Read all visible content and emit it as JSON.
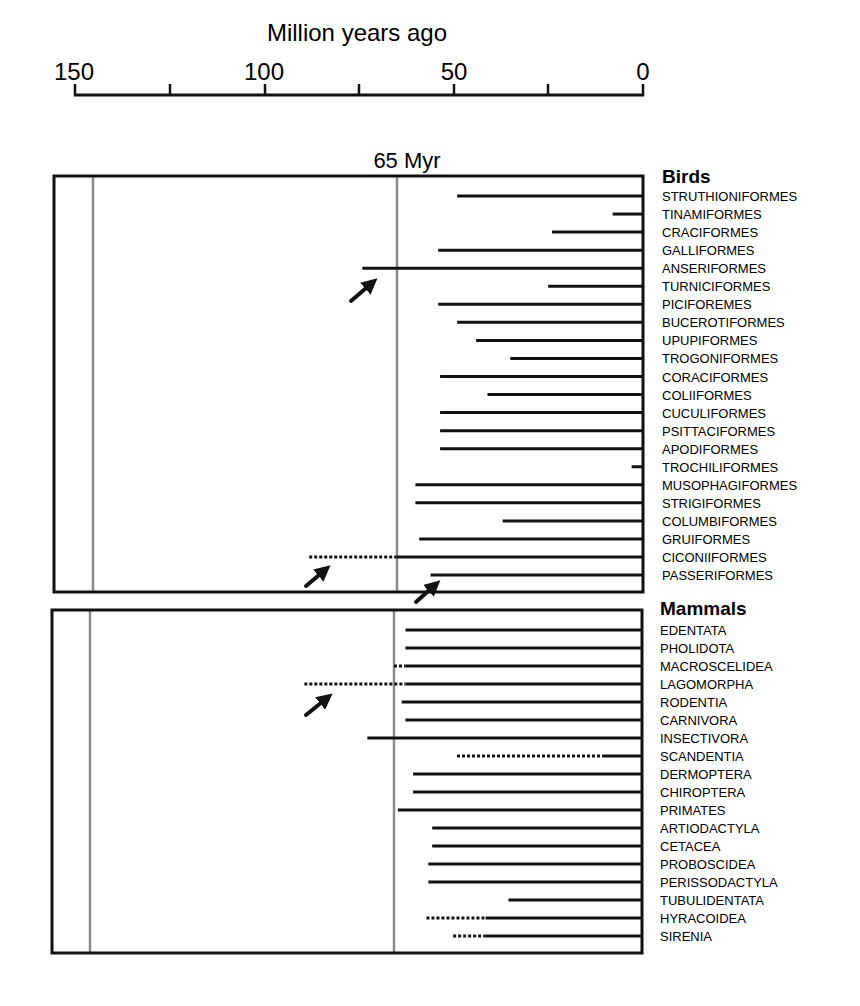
{
  "chart_data": {
    "type": "bar",
    "subtype": "horizontal range bars (divergence timelines)",
    "title": "",
    "xlabel": "Million years ago",
    "ylabel": "",
    "xlim": [
      150,
      0
    ],
    "x_ticks_major": [
      150,
      100,
      50,
      0
    ],
    "x_ticks_minor": [
      125,
      75,
      25
    ],
    "reference_line": {
      "value": 65,
      "label": "65 Myr"
    },
    "secondary_reference_line": {
      "value": 145
    },
    "legend": {
      "solid": "fossil/confirmed range",
      "dotted": "extended (molecular) estimate"
    },
    "groups": [
      {
        "name": "Birds",
        "orders": [
          {
            "name": "STRUTHIONIFORMES",
            "solid_start": 49,
            "dotted_start": null
          },
          {
            "name": "TINAMIFORMES",
            "solid_start": 8,
            "dotted_start": null
          },
          {
            "name": "CRACIFORMES",
            "solid_start": 24,
            "dotted_start": null
          },
          {
            "name": "GALLIFORMES",
            "solid_start": 54,
            "dotted_start": null
          },
          {
            "name": "ANSERIFORMES",
            "solid_start": 74,
            "dotted_start": null,
            "arrow": true
          },
          {
            "name": "TURNICIFORMES",
            "solid_start": 25,
            "dotted_start": null
          },
          {
            "name": "PICIFOREMES",
            "solid_start": 54,
            "dotted_start": null
          },
          {
            "name": "BUCEROTIFORMES",
            "solid_start": 49,
            "dotted_start": null
          },
          {
            "name": "UPUPIFORMES",
            "solid_start": 44,
            "dotted_start": null
          },
          {
            "name": "TROGONIFORMES",
            "solid_start": 35,
            "dotted_start": null
          },
          {
            "name": "CORACIFORMES",
            "solid_start": 53.5,
            "dotted_start": null
          },
          {
            "name": "COLIIFORMES",
            "solid_start": 41,
            "dotted_start": null
          },
          {
            "name": "CUCULIFORMES",
            "solid_start": 53.5,
            "dotted_start": null
          },
          {
            "name": "PSITTACIFORMES",
            "solid_start": 53.5,
            "dotted_start": null
          },
          {
            "name": "APODIFORMES",
            "solid_start": 53.5,
            "dotted_start": null
          },
          {
            "name": "TROCHILIFORMES",
            "solid_start": 3,
            "dotted_start": null
          },
          {
            "name": "MUSOPHAGIFORMES",
            "solid_start": 60,
            "dotted_start": null
          },
          {
            "name": "STRIGIFORMES",
            "solid_start": 60,
            "dotted_start": null
          },
          {
            "name": "COLUMBIFORMES",
            "solid_start": 37,
            "dotted_start": null
          },
          {
            "name": "GRUIFORMES",
            "solid_start": 59,
            "dotted_start": null
          },
          {
            "name": "CICONIIFORMES",
            "solid_start": 65,
            "dotted_start": 88,
            "arrow": true
          },
          {
            "name": "PASSERIFORMES",
            "solid_start": 56,
            "dotted_start": null,
            "arrow": true
          }
        ]
      },
      {
        "name": "Mammals",
        "orders": [
          {
            "name": "EDENTATA",
            "solid_start": 62,
            "dotted_start": null
          },
          {
            "name": "PHOLIDOTA",
            "solid_start": 62,
            "dotted_start": null
          },
          {
            "name": "MACROSCELIDEA",
            "solid_start": 62,
            "dotted_start": 65
          },
          {
            "name": "LAGOMORPHA",
            "solid_start": 62,
            "dotted_start": 88.5,
            "arrow": true
          },
          {
            "name": "RODENTIA",
            "solid_start": 63,
            "dotted_start": null
          },
          {
            "name": "CARNIVORA",
            "solid_start": 62,
            "dotted_start": null
          },
          {
            "name": "INSECTIVORA",
            "solid_start": 72,
            "dotted_start": null
          },
          {
            "name": "SCANDENTIA",
            "solid_start": 10,
            "dotted_start": 48.5
          },
          {
            "name": "DERMOPTERA",
            "solid_start": 60,
            "dotted_start": null
          },
          {
            "name": "CHIROPTERA",
            "solid_start": 60,
            "dotted_start": null
          },
          {
            "name": "PRIMATES",
            "solid_start": 64,
            "dotted_start": null
          },
          {
            "name": "ARTIODACTYLA",
            "solid_start": 55,
            "dotted_start": null
          },
          {
            "name": "CETACEA",
            "solid_start": 55,
            "dotted_start": null
          },
          {
            "name": "PROBOSCIDEA",
            "solid_start": 56,
            "dotted_start": null
          },
          {
            "name": "PERISSODACTYLA",
            "solid_start": 56,
            "dotted_start": null
          },
          {
            "name": "TUBULIDENTATA",
            "solid_start": 35,
            "dotted_start": null
          },
          {
            "name": "HYRACOIDEA",
            "solid_start": 41,
            "dotted_start": 56.5
          },
          {
            "name": "SIRENIA",
            "solid_start": 41,
            "dotted_start": 49.5
          }
        ]
      }
    ]
  },
  "labels": {
    "axis_title": "Million years ago",
    "tick_150": "150",
    "tick_100": "100",
    "tick_50": "50",
    "tick_0": "0",
    "myr_label": "65 Myr",
    "birds_title": "Birds",
    "mammals_title": "Mammals"
  },
  "colors": {
    "ink": "#111111",
    "reference_line": "#8a8a8a"
  }
}
